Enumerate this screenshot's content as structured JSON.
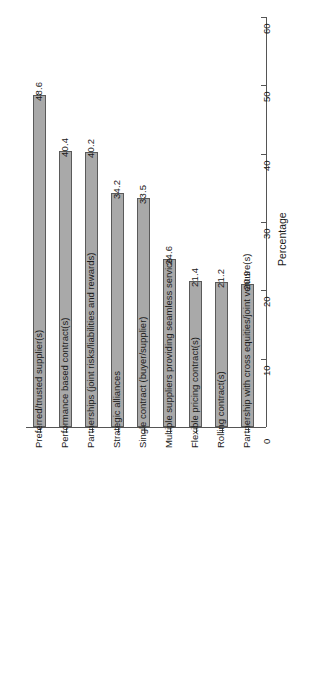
{
  "chart_data": {
    "type": "bar",
    "title": "",
    "subtitle": "",
    "orientation": "vertical-rotated",
    "xlabel": "",
    "ylabel": "Percentage",
    "ylim": [
      0,
      60
    ],
    "yticks": [
      0,
      10,
      20,
      30,
      40,
      50,
      60
    ],
    "grid": false,
    "legend": null,
    "categories": [
      "Preferred/trusted supplier(s)",
      "Performance based contract(s)",
      "Partnerships (joint risks/liabilities and rewards)",
      "Strategic alliances",
      "Single contract (buyer/supplier)",
      "Multiple suppliers providing seamless service",
      "Flexible pricing contract(s)",
      "Rolling contract(s)",
      "Partnership with cross equities/joint venture(s)"
    ],
    "values": [
      48.6,
      40.4,
      40.2,
      34.2,
      33.5,
      24.6,
      21.4,
      21.2,
      20.9
    ],
    "value_labels": [
      "48.6",
      "40.4",
      "40.2",
      "34.2",
      "33.5",
      "24.6",
      "21.4",
      "21.2",
      "20.9"
    ],
    "tick_labels": [
      "0",
      "10",
      "20",
      "30",
      "40",
      "50",
      "60"
    ],
    "colors": {
      "bar_fill": "#a9a9a9",
      "bar_border": "#5a5a5a",
      "axis": "#555555",
      "text": "#1a1a1a",
      "background": "#ffffff"
    }
  }
}
